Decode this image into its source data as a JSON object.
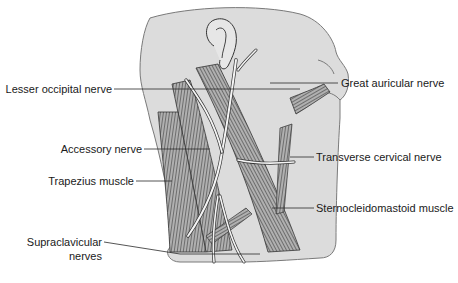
{
  "figure": {
    "type": "anatomical-illustration"
  },
  "labels": {
    "lesser_occipital": "Lesser occipital nerve",
    "great_auricular": "Great auricular nerve",
    "accessory": "Accessory nerve",
    "transverse_cervical": "Transverse cervical nerve",
    "trapezius": "Trapezius muscle",
    "sternocleidomastoid": "Sternocleidomastoid muscle",
    "supraclavicular_line1": "Supraclavicular",
    "supraclavicular_line2": "nerves"
  },
  "colors": {
    "skin": "#d9d9d9",
    "skin_edge": "#8a8a8a",
    "muscle": "#9a9a9a",
    "muscle_stripe": "#4a4a4a",
    "nerve": "#f2f2f2",
    "nerve_outline": "#3a3a3a",
    "leader_line": "#2a2a2a",
    "text": "#1a1a1a"
  }
}
